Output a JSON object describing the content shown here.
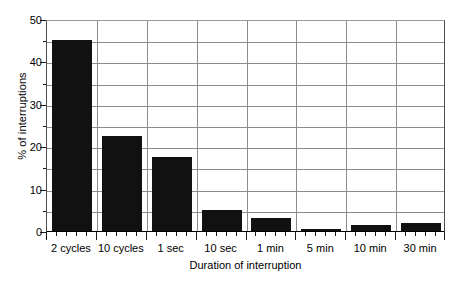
{
  "chart_data": {
    "type": "bar",
    "title": "",
    "xlabel": "Duration of interruption",
    "ylabel": "% of interruptions",
    "categories": [
      "2 cycles",
      "10 cycles",
      "1 sec",
      "10 sec",
      "1 min",
      "5 min",
      "10 min",
      "30 min"
    ],
    "values": [
      45,
      22.5,
      17.5,
      5,
      3,
      0.5,
      1.5,
      2
    ],
    "ylim": [
      0,
      50
    ],
    "y_major_ticks": [
      0,
      10,
      20,
      30,
      40,
      50
    ],
    "y_minor_ticks": [
      5,
      15,
      25,
      35,
      45
    ],
    "y_tick_labels": [
      "0",
      "10",
      "20",
      "30",
      "40",
      "50"
    ],
    "grid": "horizontal-and-category-separators",
    "legend": "none",
    "bar_color": "#111111",
    "grid_color": "#8c8c8c",
    "background_color": "#ffffff"
  },
  "axes": {
    "y_title": "% of interruptions",
    "x_title": "Duration of interruption"
  }
}
